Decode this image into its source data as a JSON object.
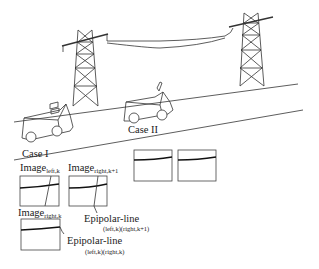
{
  "diagram": {
    "cases": [
      {
        "id": "case1",
        "label": "Case I"
      },
      {
        "id": "case2",
        "label": "Case II"
      }
    ],
    "images": [
      {
        "id": "img-left-k",
        "label": "Image",
        "subscript": "left,k"
      },
      {
        "id": "img-right-k1",
        "label": "Image",
        "subscript": "right,k+1"
      },
      {
        "id": "img-right-k",
        "label": "Image",
        "subscript": "right,k"
      }
    ],
    "epipolar_lines": [
      {
        "id": "ep-1",
        "label": "Epipolar-line",
        "subscript": "(left,k)(right,k+1)"
      },
      {
        "id": "ep-2",
        "label": "Epipolar-line",
        "subscript": "(left,k)(right,k)"
      }
    ],
    "elements": [
      "power-tower-left",
      "power-tower-right",
      "power-line",
      "road",
      "vehicle-case1",
      "vehicle-case2",
      "image-frames"
    ]
  }
}
